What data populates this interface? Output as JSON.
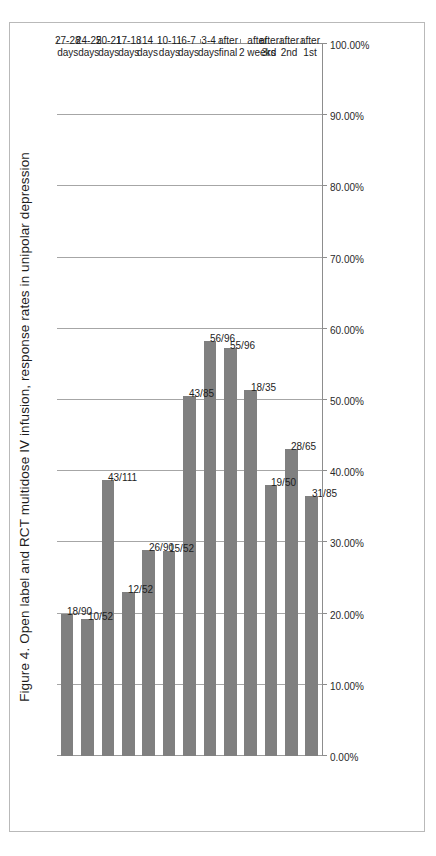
{
  "figure": {
    "title": "Figure 4. Open label  and RCT multidose IV infusion, response rates in unipolar depression",
    "frame_color": "#b9b9b9",
    "bar_color": "#808080",
    "gridline_color": "#a6a6a6",
    "axis_color": "#8d8d8d",
    "orientation": "rotated-90-ccw"
  },
  "chart_data": {
    "type": "bar",
    "title": "Figure 4. Open label  and RCT multidose IV infusion, response rates in unipolar depression",
    "xlabel": "",
    "ylabel": "",
    "orientation": "vertical-bars-rotated",
    "ylim": [
      0,
      100
    ],
    "ytick_labels": [
      "100.00%",
      "90.00%",
      "80.00%",
      "70.00%",
      "60.00%",
      "50.00%",
      "40.00%",
      "30.00%",
      "20.00%",
      "10.00%",
      "0.00%"
    ],
    "ytick_values": [
      100,
      90,
      80,
      70,
      60,
      50,
      40,
      30,
      20,
      10,
      0
    ],
    "grid": true,
    "legend": false,
    "categories": [
      "after 1st",
      "after 2nd",
      "after 3rd",
      "after 2 weeks",
      "after final",
      "3-4 days",
      "6-7 days",
      "10-11 days",
      "14 days",
      "17-18 days",
      "20-21 days",
      "24-25 days",
      "27-28 days"
    ],
    "category_lines": [
      [
        "after",
        "1st"
      ],
      [
        "after",
        "2nd"
      ],
      [
        "after",
        "3rd"
      ],
      [
        "after",
        "2 weeks"
      ],
      [
        "after",
        "final"
      ],
      [
        "3-4",
        "days"
      ],
      [
        "6-7",
        "days"
      ],
      [
        "10-11",
        "days"
      ],
      [
        "14",
        "days"
      ],
      [
        "17-18",
        "days"
      ],
      [
        "20-21",
        "days"
      ],
      [
        "24-25",
        "days"
      ],
      [
        "27-28",
        "days"
      ]
    ],
    "data_labels": [
      "31/85",
      "28/65",
      "19/50",
      "18/35",
      "55/96",
      "56/96",
      "43/85",
      "15/52",
      "26/90",
      "12/52",
      "43/111",
      "10/52",
      "18/90"
    ],
    "numerators": [
      31,
      28,
      19,
      18,
      55,
      56,
      43,
      15,
      26,
      12,
      43,
      10,
      18
    ],
    "denominators": [
      85,
      65,
      50,
      35,
      96,
      96,
      85,
      52,
      90,
      52,
      111,
      52,
      90
    ],
    "values": [
      36.47,
      43.08,
      38.0,
      51.43,
      57.29,
      58.33,
      50.59,
      28.85,
      28.89,
      23.08,
      38.74,
      19.23,
      20.0
    ]
  }
}
